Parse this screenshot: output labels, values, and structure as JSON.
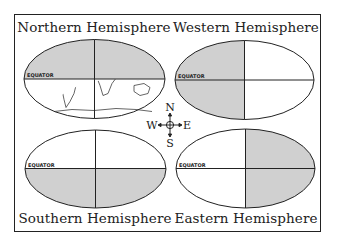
{
  "figure": {
    "title": "",
    "panels": [
      {
        "id": "northern",
        "label": "Northern Hemisphere",
        "shaded": "north",
        "position": "top-left"
      },
      {
        "id": "western",
        "label": "Western Hemisphere",
        "shaded": "west",
        "position": "top-right"
      },
      {
        "id": "southern",
        "label": "Southern Hemisphere",
        "shaded": "south",
        "position": "bottom-left"
      },
      {
        "id": "eastern",
        "label": "Eastern Hemisphere",
        "shaded": "east",
        "position": "bottom-right"
      }
    ],
    "equator_label": "EQUATOR",
    "compass": {
      "n": "N",
      "s": "S",
      "e": "E",
      "w": "W"
    },
    "colors": {
      "shade": "#d0d0d0",
      "line": "#222222",
      "background": "#ffffff"
    }
  }
}
